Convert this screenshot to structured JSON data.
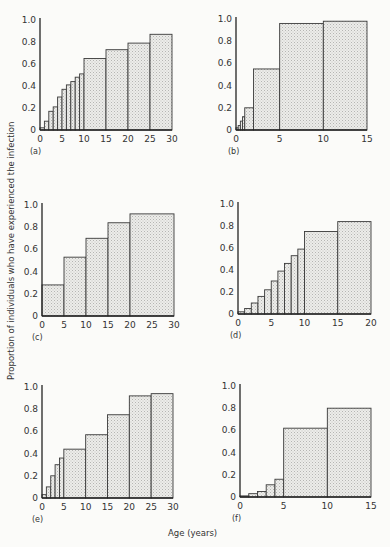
{
  "figure": {
    "ylabel": "Proportion of individuals who have experienced the infection",
    "xlabel": "Age (years)"
  },
  "chart_data": [
    {
      "panel": "(a)",
      "type": "bar",
      "xlim": [
        0,
        30
      ],
      "ylim": [
        0,
        1.0
      ],
      "xticks": [
        0,
        5,
        10,
        15,
        20,
        25,
        30
      ],
      "yticks": [
        0,
        0.2,
        0.4,
        0.6,
        0.8,
        1.0
      ],
      "bins": [
        [
          0,
          1
        ],
        [
          1,
          2
        ],
        [
          2,
          3
        ],
        [
          3,
          4
        ],
        [
          4,
          5
        ],
        [
          5,
          6
        ],
        [
          6,
          7
        ],
        [
          7,
          8
        ],
        [
          8,
          9
        ],
        [
          9,
          10
        ],
        [
          10,
          15
        ],
        [
          15,
          20
        ],
        [
          20,
          25
        ],
        [
          25,
          30
        ]
      ],
      "values": [
        0.02,
        0.08,
        0.17,
        0.21,
        0.3,
        0.37,
        0.41,
        0.44,
        0.48,
        0.51,
        0.65,
        0.73,
        0.79,
        0.87
      ]
    },
    {
      "panel": "(b)",
      "type": "bar",
      "xlim": [
        0,
        15
      ],
      "ylim": [
        0,
        1.0
      ],
      "xticks": [
        0,
        5,
        10,
        15
      ],
      "yticks": [
        0,
        0.2,
        0.4,
        0.6,
        0.8,
        1.0
      ],
      "bins": [
        [
          0,
          0.25
        ],
        [
          0.25,
          0.5
        ],
        [
          0.5,
          0.75
        ],
        [
          0.75,
          1
        ],
        [
          1,
          2
        ],
        [
          2,
          5
        ],
        [
          5,
          10
        ],
        [
          10,
          15
        ]
      ],
      "values": [
        0.02,
        0.04,
        0.08,
        0.12,
        0.2,
        0.55,
        0.96,
        0.98
      ]
    },
    {
      "panel": "(c)",
      "type": "bar",
      "xlim": [
        0,
        30
      ],
      "ylim": [
        0,
        1.0
      ],
      "xticks": [
        0,
        5,
        10,
        15,
        20,
        25,
        30
      ],
      "yticks": [
        0,
        0.2,
        0.4,
        0.6,
        0.8,
        1.0
      ],
      "bins": [
        [
          0,
          5
        ],
        [
          5,
          10
        ],
        [
          10,
          15
        ],
        [
          15,
          20
        ],
        [
          20,
          30
        ]
      ],
      "values": [
        0.28,
        0.53,
        0.7,
        0.84,
        0.92
      ]
    },
    {
      "panel": "(d)",
      "type": "bar",
      "xlim": [
        0,
        20
      ],
      "ylim": [
        0,
        1.0
      ],
      "xticks": [
        0,
        5,
        10,
        15,
        20
      ],
      "yticks": [
        0,
        0.2,
        0.4,
        0.6,
        0.8,
        1.0
      ],
      "bins": [
        [
          0,
          1
        ],
        [
          1,
          2
        ],
        [
          2,
          3
        ],
        [
          3,
          4
        ],
        [
          4,
          5
        ],
        [
          5,
          6
        ],
        [
          6,
          7
        ],
        [
          7,
          8
        ],
        [
          8,
          9
        ],
        [
          9,
          10
        ],
        [
          10,
          15
        ],
        [
          15,
          20
        ]
      ],
      "values": [
        0.02,
        0.05,
        0.1,
        0.16,
        0.22,
        0.3,
        0.39,
        0.46,
        0.53,
        0.59,
        0.75,
        0.84
      ]
    },
    {
      "panel": "(e)",
      "type": "bar",
      "xlim": [
        0,
        30
      ],
      "ylim": [
        0,
        1.0
      ],
      "xticks": [
        0,
        5,
        10,
        15,
        20,
        25,
        30
      ],
      "yticks": [
        0,
        0.2,
        0.4,
        0.6,
        0.8,
        1.0
      ],
      "bins": [
        [
          0,
          1
        ],
        [
          1,
          2
        ],
        [
          2,
          3
        ],
        [
          3,
          4
        ],
        [
          4,
          5
        ],
        [
          5,
          10
        ],
        [
          10,
          15
        ],
        [
          15,
          20
        ],
        [
          20,
          25
        ],
        [
          25,
          30
        ]
      ],
      "values": [
        0.03,
        0.1,
        0.2,
        0.3,
        0.36,
        0.44,
        0.57,
        0.75,
        0.92,
        0.94
      ]
    },
    {
      "panel": "(f)",
      "type": "bar",
      "xlim": [
        0,
        15
      ],
      "ylim": [
        0,
        1.0
      ],
      "xticks": [
        0,
        5,
        10,
        15
      ],
      "yticks": [
        0,
        0.2,
        0.4,
        0.6,
        0.8,
        1.0
      ],
      "bins": [
        [
          0,
          1
        ],
        [
          1,
          2
        ],
        [
          2,
          3
        ],
        [
          3,
          4
        ],
        [
          4,
          5
        ],
        [
          5,
          10
        ],
        [
          10,
          15
        ]
      ],
      "values": [
        0.01,
        0.03,
        0.05,
        0.11,
        0.16,
        0.62,
        0.8
      ]
    }
  ]
}
